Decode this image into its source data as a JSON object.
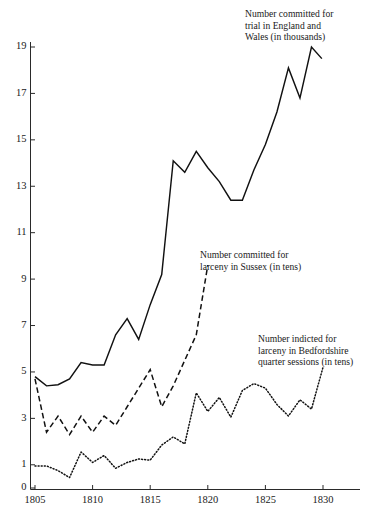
{
  "chart_data": {
    "type": "line",
    "title": "",
    "xlabel": "",
    "ylabel": "",
    "xlim": [
      1804,
      1833
    ],
    "ylim": [
      0,
      20
    ],
    "grid": false,
    "legend_position": "inline-annotations",
    "xticks": [
      1805,
      1810,
      1815,
      1820,
      1825,
      1830
    ],
    "xtick_labels": [
      "1805",
      "1810",
      "1815",
      "1820",
      "1825",
      "1830"
    ],
    "yticks": [
      0,
      1,
      3,
      5,
      7,
      9,
      11,
      13,
      15,
      17,
      19
    ],
    "ytick_labels": [
      "0",
      "1",
      "3",
      "5",
      "7",
      "9",
      "11",
      "13",
      "15",
      "17",
      "19"
    ],
    "series": [
      {
        "name": "Number committed for trial in England and Wales (in thousands)",
        "style": "solid",
        "x": [
          1805,
          1806,
          1807,
          1808,
          1809,
          1810,
          1811,
          1812,
          1813,
          1814,
          1815,
          1816,
          1817,
          1818,
          1819,
          1820,
          1821,
          1822,
          1823,
          1824,
          1825,
          1826,
          1827,
          1828,
          1829
        ],
        "values": [
          4.8,
          4.4,
          4.45,
          4.7,
          5.4,
          5.3,
          5.3,
          6.6,
          7.3,
          6.4,
          7.9,
          9.2,
          14.1,
          13.6,
          14.5,
          13.8,
          13.2,
          12.4,
          12.4,
          13.7,
          14.8,
          16.2,
          18.1,
          16.8,
          19.0
        ],
        "note": "final point drops to 18.5 at series end"
      },
      {
        "name": "Number committed for larceny in Sussex (in tens)",
        "style": "dashed",
        "x": [
          1805,
          1806,
          1807,
          1808,
          1809,
          1810,
          1811,
          1812,
          1813,
          1814,
          1815,
          1816,
          1817,
          1818,
          1819,
          1820
        ],
        "values": [
          4.7,
          2.4,
          3.1,
          2.3,
          3.1,
          2.4,
          3.1,
          2.7,
          3.5,
          4.3,
          5.1,
          3.5,
          4.4,
          5.5,
          6.6,
          9.6
        ]
      },
      {
        "name": "Number indicted for larceny in Bedfordshire quarter sessions (in tens)",
        "style": "dotted",
        "x": [
          1805,
          1806,
          1807,
          1808,
          1809,
          1810,
          1811,
          1812,
          1813,
          1814,
          1815,
          1816,
          1817,
          1818,
          1819,
          1820,
          1821,
          1822,
          1823,
          1824,
          1825,
          1826,
          1827,
          1828,
          1829,
          1830
        ],
        "values": [
          0.95,
          0.95,
          0.75,
          0.45,
          1.55,
          1.1,
          1.4,
          0.85,
          1.1,
          1.25,
          1.2,
          1.85,
          2.2,
          1.9,
          4.1,
          3.3,
          3.9,
          3.05,
          4.2,
          4.5,
          4.3,
          3.6,
          3.1,
          3.8,
          3.4,
          5.2
        ]
      }
    ]
  },
  "annotations": {
    "england": {
      "line1": "Number committed for",
      "line2": "trial in England and",
      "line3": "Wales (in thousands)"
    },
    "sussex": {
      "line1": "Number committed for",
      "line2": "larceny in Sussex (in tens)"
    },
    "bedfordshire": {
      "line1": "Number indicted for",
      "line2": "larceny in Bedfordshire",
      "line3": "quarter sessions (in tens)"
    }
  },
  "colors": {
    "ink": "#111111",
    "background": "#ffffff"
  }
}
